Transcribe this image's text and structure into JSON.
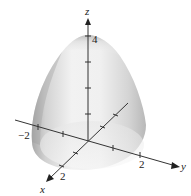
{
  "figure": {
    "axes": {
      "x": {
        "label": "x",
        "tick_label": "2"
      },
      "y": {
        "label": "y",
        "tick_label_pos": "2",
        "tick_label_neg": "−2"
      },
      "z": {
        "label": "z",
        "tick_label": "4"
      }
    },
    "colors": {
      "surface_light": "#f4f4f4",
      "surface_mid": "#d8d8d8",
      "surface_dark": "#a8a8a8",
      "axis": "#333333"
    }
  }
}
